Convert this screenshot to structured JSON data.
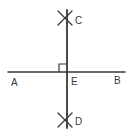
{
  "figure": {
    "kind": "geometry-construction-diagram",
    "width": 136,
    "height": 139,
    "background_color": "#ffffff",
    "stroke_color": "#39393a",
    "label_color": "#39393a"
  },
  "labels": {
    "a": "A",
    "b": "B",
    "c": "C",
    "d": "D",
    "e": "E"
  },
  "label_positions": {
    "a": {
      "x": 11,
      "y": 86
    },
    "b": {
      "x": 114,
      "y": 84
    },
    "c": {
      "x": 75,
      "y": 24
    },
    "d": {
      "x": 75,
      "y": 125
    },
    "e": {
      "x": 71,
      "y": 85
    }
  },
  "geometry": {
    "horizontal_line": {
      "name": "line-ab",
      "x1": 8,
      "y1": 72,
      "x2": 125,
      "y2": 72,
      "stroke_width": 1.6
    },
    "vertical_line": {
      "name": "line-cd",
      "x1": 67,
      "y1": 10,
      "x2": 67,
      "y2": 128,
      "stroke_width": 1.8
    },
    "intersection_point": {
      "name": "point-e",
      "x": 67,
      "y": 72
    },
    "right_angle_marker": {
      "name": "right-angle-square",
      "x": 59,
      "y": 64,
      "size": 8,
      "quadrant": "upper-left",
      "stroke_width": 1.2
    },
    "arc_marks": [
      {
        "name": "arc-mark-c",
        "center_x": 65,
        "center_y": 18,
        "stroke_width": 1.3,
        "strokes": [
          {
            "x1": 58,
            "y1": 11,
            "x2": 72,
            "y2": 25
          },
          {
            "x1": 72,
            "y1": 11,
            "x2": 58,
            "y2": 25
          }
        ]
      },
      {
        "name": "arc-mark-d",
        "center_x": 65,
        "center_y": 120,
        "stroke_width": 1.3,
        "strokes": [
          {
            "x1": 58,
            "y1": 113,
            "x2": 72,
            "y2": 127
          },
          {
            "x1": 72,
            "y1": 113,
            "x2": 58,
            "y2": 127
          }
        ]
      }
    ]
  }
}
